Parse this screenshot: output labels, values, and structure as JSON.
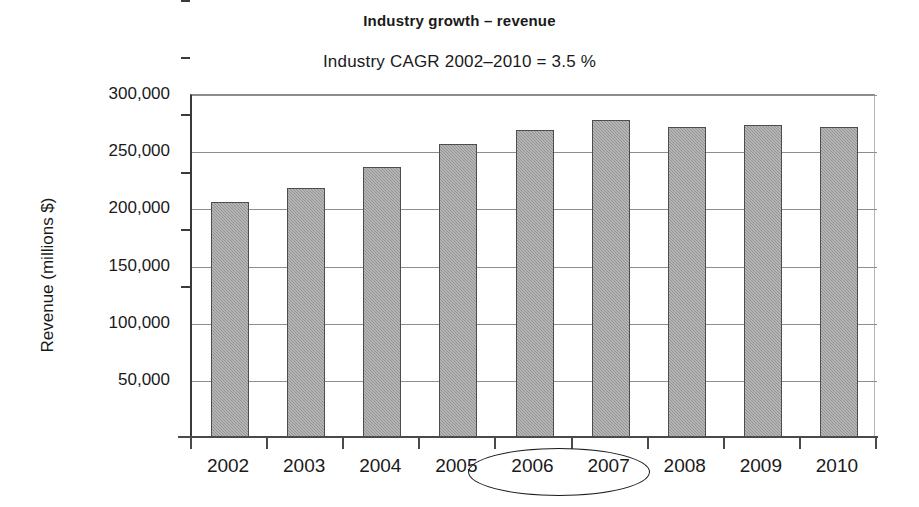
{
  "chart_data": {
    "type": "bar",
    "title": "Industry growth – revenue",
    "subtitle": "Industry CAGR 2002–2010 = 3.5 %",
    "xlabel": "",
    "ylabel": "Revenue (millions $)",
    "categories": [
      "2002",
      "2003",
      "2004",
      "2005",
      "2006",
      "2007",
      "2008",
      "2009",
      "2010"
    ],
    "values": [
      206000,
      218500,
      237000,
      257000,
      269000,
      278000,
      272000,
      274000,
      272000
    ],
    "ylim": [
      0,
      300000
    ],
    "ytick_values": [
      50000,
      100000,
      150000,
      200000,
      250000,
      300000
    ],
    "ytick_labels": [
      "50,000",
      "100,000",
      "150,000",
      "200,000",
      "250,000",
      "300,000"
    ],
    "grid": true,
    "legend": false,
    "bar_color": "#9d9d9d",
    "bar_border_color": "#4d4d4d",
    "annotations": [
      {
        "type": "ellipse",
        "label": "highlight-2006-2007",
        "covers": [
          "2006",
          "2007"
        ]
      }
    ]
  }
}
